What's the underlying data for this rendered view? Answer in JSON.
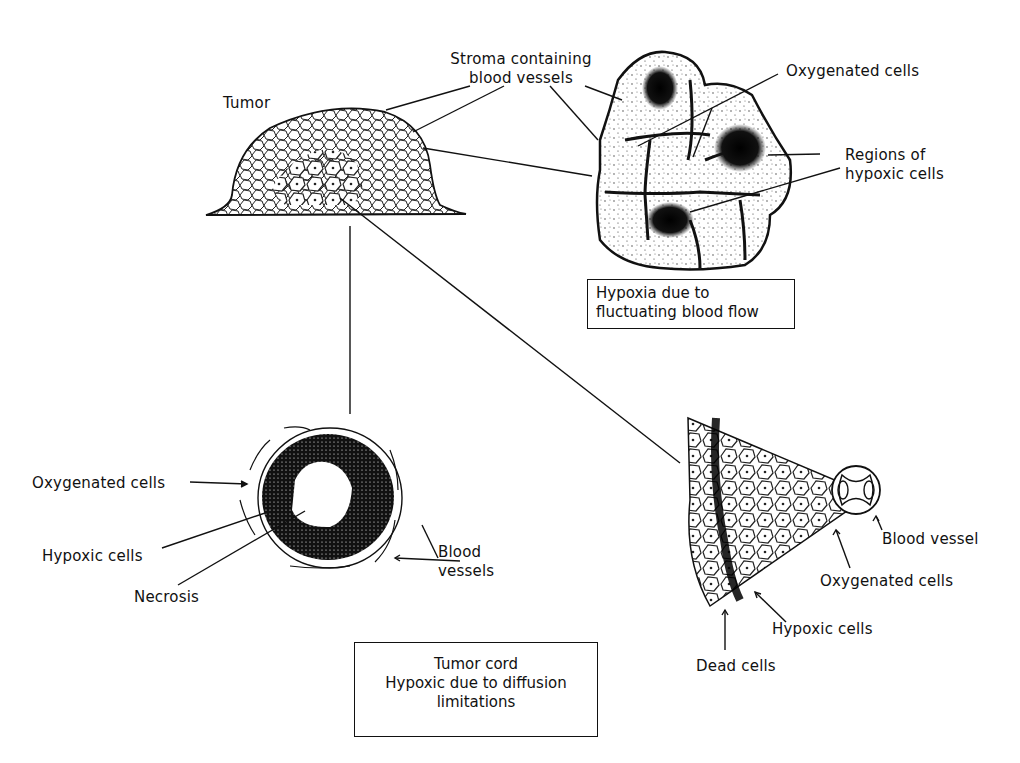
{
  "diagram": {
    "topic": "Tumor hypoxia: chronic (diffusion-limited) and acute (fluctuating blood flow)",
    "tumor": {
      "label": "Tumor",
      "stroma_label_line1": "Stroma containing",
      "stroma_label_line2": "blood vessels"
    },
    "fluctuating_panel": {
      "oxygenated_label": "Oxygenated cells",
      "hypoxic_label_line1": "Regions of",
      "hypoxic_label_line2": "hypoxic cells",
      "caption_line1": "Hypoxia due to",
      "caption_line2": "fluctuating blood flow"
    },
    "cord_cross_section": {
      "oxygenated_label": "Oxygenated cells",
      "hypoxic_label": "Hypoxic cells",
      "necrosis_label": "Necrosis",
      "vessels_label_line1": "Blood",
      "vessels_label_line2": "vessels"
    },
    "cord_wedge": {
      "vessel_label": "Blood vessel",
      "oxygenated_label": "Oxygenated cells",
      "hypoxic_label": "Hypoxic cells",
      "dead_label": "Dead cells"
    },
    "cord_caption": {
      "line1": "Tumor cord",
      "line2": "Hypoxic due to diffusion",
      "line3": "limitations"
    }
  }
}
